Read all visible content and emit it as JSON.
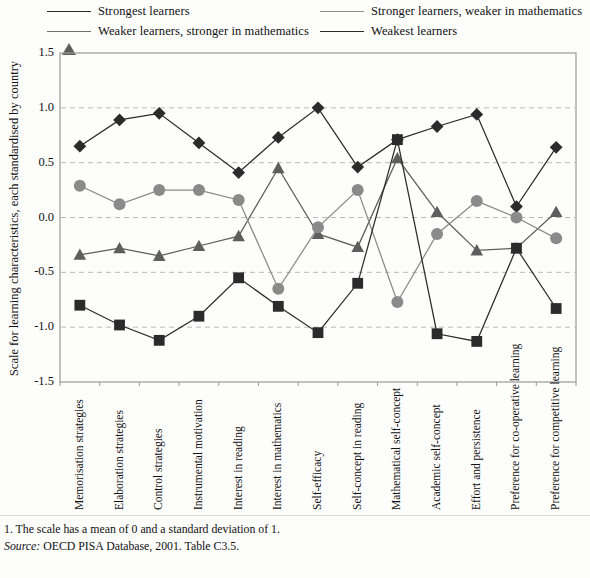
{
  "legend": {
    "items": [
      {
        "label": "Strongest learners",
        "marker": "diamond",
        "color": "#2b2b2b"
      },
      {
        "label": "Weaker learners, stronger in mathematics",
        "marker": "triangle",
        "color": "#5e5e5e"
      },
      {
        "label": "Stronger learners, weaker in mathematics",
        "marker": "circle",
        "color": "#8a8a8a"
      },
      {
        "label": "Weakest learners",
        "marker": "square",
        "color": "#2b2b2b"
      }
    ]
  },
  "axis": {
    "ylabel": "Scale for learning characteristics, each standardised by country",
    "yticks": [
      "1.5",
      "1.0",
      "0.5",
      "0.0",
      "-0.5",
      "-1.0",
      "-1.5"
    ]
  },
  "footer": {
    "note": "1. The scale has a mean of 0 and a standard deviation of 1.",
    "source_label": "Source:",
    "source_text": " OECD PISA Database, 2001. Table C3.5."
  },
  "chart_data": {
    "type": "line",
    "title": "",
    "xlabel": "",
    "ylabel": "Scale for learning characteristics, each standardised by country",
    "ylim": [
      -1.5,
      1.5
    ],
    "ytick_step": 0.5,
    "grid": true,
    "legend_position": "top",
    "categories": [
      "Memorisation strategies",
      "Elaboration strategies",
      "Control strategies",
      "Instrumental motivation",
      "Interest in reading",
      "Interest in mathematics",
      "Self-efficacy",
      "Self-concept in reading",
      "Mathematical self-concept",
      "Academic self-concept",
      "Effort and persistence",
      "Preference for co-operative learning",
      "Preference for competitive learning"
    ],
    "series": [
      {
        "name": "Strongest learners",
        "marker": "diamond",
        "color": "#2b2b2b",
        "values": [
          0.65,
          0.89,
          0.95,
          0.68,
          0.41,
          0.73,
          1.0,
          0.46,
          0.71,
          0.83,
          0.94,
          0.1,
          0.64
        ]
      },
      {
        "name": "Weaker learners, stronger in mathematics",
        "marker": "triangle",
        "color": "#5e5e5e",
        "values": [
          -0.34,
          -0.28,
          -0.35,
          -0.26,
          -0.17,
          0.45,
          -0.15,
          -0.27,
          0.54,
          0.05,
          -0.3,
          -0.28,
          0.05
        ]
      },
      {
        "name": "Stronger learners, weaker in mathematics",
        "marker": "circle",
        "color": "#8a8a8a",
        "values": [
          0.29,
          0.12,
          0.25,
          0.25,
          0.16,
          -0.65,
          -0.09,
          0.25,
          -0.77,
          -0.15,
          0.15,
          0.0,
          -0.19
        ]
      },
      {
        "name": "Weakest learners",
        "marker": "square",
        "color": "#2b2b2b",
        "values": [
          -0.8,
          -0.98,
          -1.12,
          -0.9,
          -0.55,
          -0.81,
          -1.05,
          -0.6,
          0.71,
          -1.06,
          -1.13,
          -0.28,
          -0.83
        ]
      }
    ]
  }
}
